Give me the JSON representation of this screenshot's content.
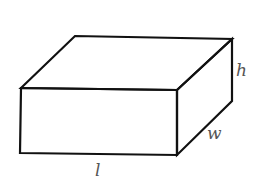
{
  "figure": {
    "labels": {
      "length": "l",
      "width": "w",
      "height": "h"
    },
    "colors": {
      "stroke": "#111111",
      "label": "#555555",
      "background": "#ffffff"
    }
  }
}
